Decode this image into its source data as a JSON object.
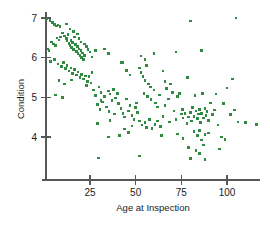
{
  "chart_data": {
    "type": "scatter",
    "title": "",
    "xlabel": "Age at Inspection",
    "ylabel": "Condition",
    "xlim": [
      0,
      118
    ],
    "ylim": [
      3.1,
      7.15
    ],
    "xticks": [
      25,
      50,
      75,
      100
    ],
    "yticks": [
      4,
      5,
      6,
      7
    ],
    "xtick_labels": [
      "25",
      "50",
      "75",
      "100"
    ],
    "ytick_labels": [
      "4",
      "5",
      "6",
      "7"
    ],
    "grid": false,
    "legend": "none",
    "marker_color": "#2e8b40",
    "marker_size": 2.6,
    "axis_color": "#58585a",
    "series": [
      {
        "name": "Bridges",
        "points": [
          [
            1.5,
            6.97
          ],
          [
            3.0,
            6.93
          ],
          [
            4.5,
            6.88
          ],
          [
            5.5,
            6.84
          ],
          [
            6.5,
            6.8
          ],
          [
            7.5,
            6.82
          ],
          [
            8.5,
            6.78
          ],
          [
            2.0,
            6.22
          ],
          [
            2.5,
            6.18
          ],
          [
            4.0,
            6.4
          ],
          [
            5.0,
            6.34
          ],
          [
            6.0,
            6.3
          ],
          [
            7.0,
            6.5
          ],
          [
            8.0,
            6.45
          ],
          [
            9.0,
            6.52
          ],
          [
            10.0,
            6.62
          ],
          [
            11.0,
            6.55
          ],
          [
            12.0,
            6.48
          ],
          [
            12.5,
            6.42
          ],
          [
            13.0,
            6.58
          ],
          [
            13.5,
            6.36
          ],
          [
            14.0,
            6.3
          ],
          [
            14.5,
            6.44
          ],
          [
            15.0,
            6.26
          ],
          [
            15.5,
            6.38
          ],
          [
            16.0,
            6.2
          ],
          [
            16.5,
            6.52
          ],
          [
            17.0,
            6.33
          ],
          [
            17.5,
            6.16
          ],
          [
            18.0,
            6.28
          ],
          [
            18.5,
            6.1
          ],
          [
            19.0,
            6.22
          ],
          [
            19.5,
            6.05
          ],
          [
            20.0,
            6.18
          ],
          [
            20.5,
            6.0
          ],
          [
            21.0,
            6.12
          ],
          [
            21.5,
            5.95
          ],
          [
            22.0,
            6.06
          ],
          [
            12.0,
            6.85
          ],
          [
            14.0,
            6.72
          ],
          [
            16.0,
            6.66
          ],
          [
            18.0,
            6.6
          ],
          [
            19.0,
            6.48
          ],
          [
            20.0,
            6.4
          ],
          [
            22.0,
            6.34
          ],
          [
            23.0,
            6.28
          ],
          [
            24.0,
            6.2
          ],
          [
            25.0,
            6.14
          ],
          [
            26.0,
            6.02
          ],
          [
            28.0,
            6.18
          ],
          [
            33.0,
            6.22
          ],
          [
            35.0,
            6.1
          ],
          [
            42.0,
            5.88
          ],
          [
            53.0,
            6.04
          ],
          [
            55.0,
            5.96
          ],
          [
            60.0,
            6.1
          ],
          [
            72.0,
            6.14
          ],
          [
            80.0,
            6.92
          ],
          [
            86.0,
            6.18
          ],
          [
            105.0,
            7.0
          ],
          [
            3.5,
            5.9
          ],
          [
            5.5,
            5.96
          ],
          [
            7.5,
            5.84
          ],
          [
            9.5,
            5.78
          ],
          [
            10.5,
            5.88
          ],
          [
            11.5,
            5.72
          ],
          [
            12.5,
            5.8
          ],
          [
            13.5,
            5.66
          ],
          [
            14.5,
            5.74
          ],
          [
            15.5,
            5.6
          ],
          [
            16.5,
            5.7
          ],
          [
            17.5,
            5.56
          ],
          [
            18.5,
            5.64
          ],
          [
            19.5,
            5.5
          ],
          [
            20.5,
            5.58
          ],
          [
            21.5,
            5.46
          ],
          [
            22.5,
            5.54
          ],
          [
            23.5,
            5.4
          ],
          [
            24.5,
            5.52
          ],
          [
            25.5,
            5.36
          ],
          [
            8.0,
            5.42
          ],
          [
            11.0,
            5.34
          ],
          [
            15.0,
            5.44
          ],
          [
            23.0,
            5.3
          ],
          [
            26.0,
            5.62
          ],
          [
            27.0,
            5.18
          ],
          [
            28.0,
            5.04
          ],
          [
            30.0,
            5.26
          ],
          [
            31.0,
            5.12
          ],
          [
            33.0,
            5.02
          ],
          [
            35.0,
            5.16
          ],
          [
            36.0,
            5.08
          ],
          [
            38.0,
            5.2
          ],
          [
            39.0,
            4.98
          ],
          [
            40.0,
            5.1
          ],
          [
            6.0,
            5.06
          ],
          [
            10.0,
            5.0
          ],
          [
            29.0,
            4.82
          ],
          [
            30.5,
            4.7
          ],
          [
            32.0,
            4.88
          ],
          [
            34.0,
            4.76
          ],
          [
            35.5,
            4.64
          ],
          [
            37.0,
            4.92
          ],
          [
            38.5,
            4.58
          ],
          [
            40.5,
            4.84
          ],
          [
            42.0,
            4.72
          ],
          [
            43.0,
            4.6
          ],
          [
            44.0,
            4.5
          ],
          [
            45.0,
            4.96
          ],
          [
            46.0,
            4.66
          ],
          [
            47.0,
            4.8
          ],
          [
            48.0,
            4.54
          ],
          [
            49.0,
            4.44
          ],
          [
            50.0,
            4.74
          ],
          [
            50.5,
            4.86
          ],
          [
            51.0,
            4.62
          ],
          [
            52.0,
            5.74
          ],
          [
            53.0,
            5.62
          ],
          [
            54.0,
            5.52
          ],
          [
            55.0,
            5.42
          ],
          [
            56.0,
            5.8
          ],
          [
            57.0,
            5.34
          ],
          [
            58.0,
            5.26
          ],
          [
            54.5,
            5.1
          ],
          [
            56.5,
            5.02
          ],
          [
            58.5,
            4.94
          ],
          [
            60.0,
            5.18
          ],
          [
            61.0,
            4.86
          ],
          [
            62.0,
            4.76
          ],
          [
            63.0,
            5.06
          ],
          [
            52.0,
            4.4
          ],
          [
            53.5,
            4.3
          ],
          [
            55.0,
            4.36
          ],
          [
            56.0,
            4.24
          ],
          [
            57.5,
            4.44
          ],
          [
            59.0,
            4.22
          ],
          [
            60.5,
            4.32
          ],
          [
            62.0,
            4.4
          ],
          [
            63.5,
            4.26
          ],
          [
            65.0,
            4.52
          ],
          [
            44.0,
            4.2
          ],
          [
            46.0,
            4.12
          ],
          [
            48.0,
            4.28
          ],
          [
            41.0,
            4.04
          ],
          [
            35.0,
            4.0
          ],
          [
            29.0,
            4.34
          ],
          [
            29.5,
            3.47
          ],
          [
            52.0,
            3.52
          ],
          [
            65.0,
            5.66
          ],
          [
            66.0,
            5.4
          ],
          [
            68.0,
            4.96
          ],
          [
            70.0,
            5.12
          ],
          [
            71.0,
            4.66
          ],
          [
            72.0,
            4.44
          ],
          [
            73.0,
            5.02
          ],
          [
            74.0,
            5.1
          ],
          [
            75.0,
            4.58
          ],
          [
            75.5,
            4.7
          ],
          [
            76.0,
            4.48
          ],
          [
            77.0,
            4.6
          ],
          [
            78.0,
            4.34
          ],
          [
            78.5,
            5.5
          ],
          [
            79.0,
            4.5
          ],
          [
            80.0,
            4.62
          ],
          [
            80.5,
            4.4
          ],
          [
            81.0,
            4.74
          ],
          [
            82.0,
            4.52
          ],
          [
            82.5,
            5.04
          ],
          [
            83.0,
            4.66
          ],
          [
            84.0,
            4.46
          ],
          [
            84.5,
            4.58
          ],
          [
            85.0,
            4.7
          ],
          [
            85.5,
            4.36
          ],
          [
            86.0,
            4.6
          ],
          [
            86.5,
            5.1
          ],
          [
            87.0,
            4.48
          ],
          [
            88.0,
            4.72
          ],
          [
            88.5,
            4.54
          ],
          [
            89.0,
            4.64
          ],
          [
            90.0,
            4.42
          ],
          [
            91.0,
            4.86
          ],
          [
            92.0,
            4.56
          ],
          [
            93.0,
            4.68
          ],
          [
            94.0,
            5.08
          ],
          [
            95.0,
            4.3
          ],
          [
            73.0,
            4.08
          ],
          [
            76.0,
            3.96
          ],
          [
            82.0,
            4.14
          ],
          [
            84.0,
            4.04
          ],
          [
            85.0,
            4.16
          ],
          [
            86.0,
            3.92
          ],
          [
            88.0,
            4.06
          ],
          [
            90.0,
            4.1
          ],
          [
            79.0,
            3.74
          ],
          [
            83.0,
            3.66
          ],
          [
            85.0,
            3.58
          ],
          [
            87.0,
            3.8
          ],
          [
            80.0,
            3.46
          ],
          [
            88.0,
            3.44
          ],
          [
            96.0,
            3.7
          ],
          [
            98.0,
            4.84
          ],
          [
            100.0,
            5.24
          ],
          [
            102.0,
            4.56
          ],
          [
            104.0,
            4.68
          ],
          [
            106.0,
            4.38
          ],
          [
            97.0,
            4.0
          ],
          [
            99.0,
            3.94
          ],
          [
            103.0,
            5.46
          ],
          [
            110.0,
            4.36
          ],
          [
            116.0,
            4.32
          ],
          [
            66.0,
            4.8
          ],
          [
            67.0,
            5.22
          ],
          [
            68.5,
            4.38
          ],
          [
            69.0,
            5.34
          ],
          [
            64.0,
            4.04
          ],
          [
            45.0,
            5.68
          ],
          [
            47.0,
            5.56
          ],
          [
            43.0,
            5.88
          ],
          [
            36.0,
            4.42
          ],
          [
            31.0,
            4.92
          ]
        ]
      }
    ]
  }
}
